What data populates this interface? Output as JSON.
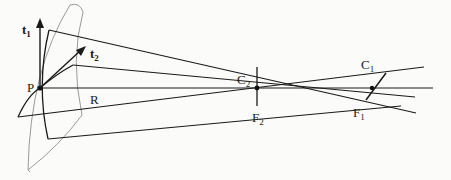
{
  "diagram": {
    "labels": {
      "t1": "t",
      "t1_sub": "1",
      "t2": "t",
      "t2_sub": "2",
      "P": "P",
      "R": "R",
      "C2": "C",
      "C2_sub": "2",
      "F2": "F",
      "F2_sub": "2",
      "C1": "C",
      "C1_sub": "1",
      "F1": "F",
      "F1_sub": "1"
    },
    "colors": {
      "line": "#1a1a1a",
      "surface": "#9a9a9a",
      "background": "#fbfbfa"
    }
  }
}
